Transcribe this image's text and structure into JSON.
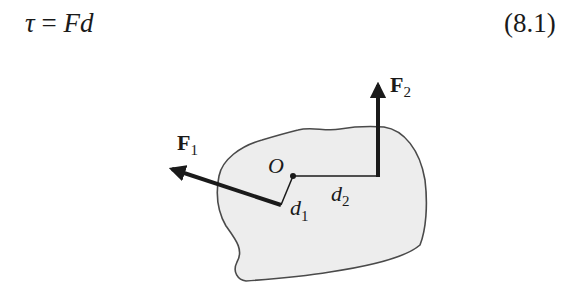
{
  "equation": {
    "symbol": "τ",
    "equals": "=",
    "rhs": "Fd",
    "number": "(8.1)"
  },
  "figure": {
    "origin_label": "O",
    "forces": [
      {
        "label": "F",
        "subscript": "1"
      },
      {
        "label": "F",
        "subscript": "2"
      }
    ],
    "distances": [
      {
        "label": "d",
        "subscript": "1"
      },
      {
        "label": "d",
        "subscript": "2"
      }
    ],
    "colors": {
      "body_fill": "#ededed",
      "outline": "#4a4a4a",
      "ink": "#1a1a1a"
    }
  }
}
